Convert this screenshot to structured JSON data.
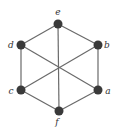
{
  "diagram": {
    "type": "graph",
    "vertices": [
      {
        "id": "e",
        "label": "e",
        "x": 58,
        "y": 24,
        "label_x": 58,
        "label_y": 15
      },
      {
        "id": "b",
        "label": "b",
        "x": 98,
        "y": 45,
        "label_x": 107,
        "label_y": 48
      },
      {
        "id": "a",
        "label": "a",
        "x": 98,
        "y": 90,
        "label_x": 108,
        "label_y": 94
      },
      {
        "id": "f",
        "label": "f",
        "x": 59,
        "y": 111,
        "label_x": 57,
        "label_y": 125
      },
      {
        "id": "c",
        "label": "c",
        "x": 21,
        "y": 90,
        "label_x": 11,
        "label_y": 94
      },
      {
        "id": "d",
        "label": "d",
        "x": 21,
        "y": 45,
        "label_x": 11,
        "label_y": 48
      }
    ],
    "edges": [
      [
        "e",
        "b"
      ],
      [
        "b",
        "a"
      ],
      [
        "a",
        "f"
      ],
      [
        "f",
        "c"
      ],
      [
        "c",
        "d"
      ],
      [
        "d",
        "e"
      ],
      [
        "e",
        "f"
      ],
      [
        "d",
        "a"
      ],
      [
        "b",
        "c"
      ]
    ],
    "colors": {
      "vertex": "#3a3a3a",
      "edge": "#6a6a6a",
      "label": "#333333",
      "background": "#ffffff"
    }
  }
}
